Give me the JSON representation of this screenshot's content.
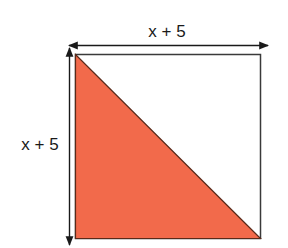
{
  "diagram": {
    "shape": "square",
    "top_label": "x + 5",
    "side_label": "x + 5",
    "colors": {
      "fill_triangle": "#f26a4b",
      "stroke": "#2a2a2a",
      "background": "#ffffff"
    }
  }
}
